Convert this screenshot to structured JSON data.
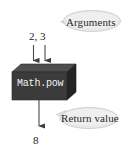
{
  "figure": {
    "type": "diagram",
    "background_color": "#ffffff"
  },
  "callouts": [
    {
      "id": "arguments",
      "label": "Arguments",
      "points_to": "input-arrows",
      "fill_color": "#e8e8e8",
      "text_color": "#2a2a2a"
    },
    {
      "id": "return-value",
      "label": "Return value",
      "points_to": "output-arrow",
      "fill_color": "#e8e8e8",
      "text_color": "#2a2a2a"
    }
  ],
  "inputs": {
    "values_label": "2, 3",
    "arrow_count": 2,
    "arrow_color": "#4a4a4a"
  },
  "method_box": {
    "label": "Math.pow",
    "face_color": "#3b3b3b",
    "top_color": "#4c4c4c",
    "side_color": "#262626",
    "text_color": "#f2f2f2"
  },
  "output": {
    "value_label": "8",
    "arrow_count": 1,
    "arrow_color": "#4a4a4a"
  }
}
